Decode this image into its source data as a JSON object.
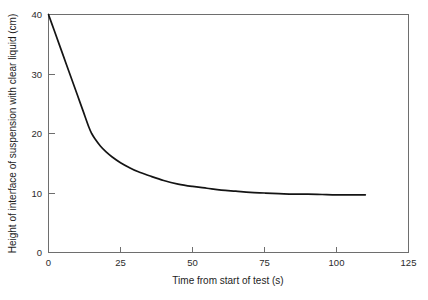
{
  "chart_data": {
    "type": "line",
    "title": "",
    "xlabel": "Time from start of test (s)",
    "ylabel": "Height of interface of suspension with clear liquid (cm)",
    "xlim": [
      0,
      125
    ],
    "ylim": [
      0,
      40
    ],
    "xticks": [
      0,
      25,
      50,
      75,
      100,
      125
    ],
    "yticks": [
      0,
      10,
      20,
      30,
      40
    ],
    "xtick_labels": [
      "0",
      "25",
      "50",
      "75",
      "100",
      "125"
    ],
    "ytick_labels": [
      "0",
      "10",
      "20",
      "30",
      "40"
    ],
    "grid": false,
    "legend": null,
    "series": [
      {
        "name": "Interface height",
        "color": "#141414",
        "x": [
          0,
          2,
          4,
          6,
          8,
          10,
          12,
          14,
          15,
          16,
          18,
          20,
          22,
          25,
          28,
          31,
          35,
          40,
          45,
          50,
          55,
          60,
          65,
          70,
          75,
          80,
          85,
          90,
          95,
          100,
          105,
          110
        ],
        "y": [
          40.0,
          37.3,
          34.6,
          31.9,
          29.2,
          26.5,
          23.8,
          21.1,
          20.0,
          19.2,
          17.9,
          16.9,
          16.1,
          15.1,
          14.3,
          13.6,
          12.9,
          12.1,
          11.5,
          11.1,
          10.8,
          10.5,
          10.3,
          10.1,
          10.0,
          9.9,
          9.8,
          9.8,
          9.75,
          9.7,
          9.7,
          9.7
        ]
      }
    ],
    "annotations": []
  },
  "axis": {
    "x_title": "Time from start of test (s)",
    "y_title": "Height of interface of suspension with clear liquid (cm)"
  }
}
